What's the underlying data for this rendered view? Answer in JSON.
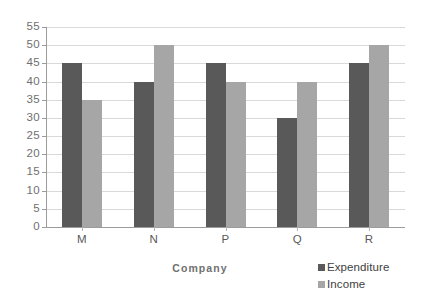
{
  "chart_data": {
    "type": "bar",
    "title": "",
    "subtitle": "",
    "xlabel": "Company",
    "ylabel": "",
    "categories": [
      "M",
      "N",
      "P",
      "Q",
      "R"
    ],
    "series": [
      {
        "name": "Expenditure",
        "color": "#595959",
        "values": [
          45,
          40,
          45,
          30,
          45
        ]
      },
      {
        "name": "Income",
        "color": "#a6a6a6",
        "values": [
          35,
          50,
          40,
          40,
          50
        ]
      }
    ],
    "ylim": [
      0,
      55
    ],
    "ytick_step": 5,
    "yticks": [
      0,
      5,
      10,
      15,
      20,
      25,
      30,
      35,
      40,
      45,
      50,
      55
    ],
    "ytick_labels": [
      "0",
      "5",
      "10",
      "15",
      "20",
      "25",
      "30",
      "35",
      "40",
      "45",
      "50",
      "55"
    ],
    "grid": true,
    "grid_axis": "y",
    "legend_position": "bottom-right",
    "background_color": "#ffffff",
    "gridline_color": "#d9d9d9",
    "axis_color": "#9c9c9c",
    "tick_label_color": "#6f6f6f"
  }
}
